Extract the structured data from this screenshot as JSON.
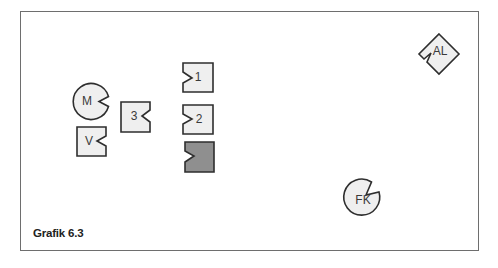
{
  "caption": "Grafik 6.3",
  "colors": {
    "fill": "#efefef",
    "dark_fill": "#8f8f8f",
    "stroke": "#2e2e2e",
    "frame": "#6e6e6e"
  },
  "shapes": [
    {
      "id": "M",
      "label": "M",
      "type": "circle-notch"
    },
    {
      "id": "V",
      "label": "V",
      "type": "square-notch"
    },
    {
      "id": "3",
      "label": "3",
      "type": "square-notch"
    },
    {
      "id": "1",
      "label": "1",
      "type": "square-notch-left"
    },
    {
      "id": "2",
      "label": "2",
      "type": "square-notch-left"
    },
    {
      "id": "dark",
      "label": "",
      "type": "square-notch-left-dark"
    },
    {
      "id": "AL",
      "label": "AL",
      "type": "diamond-notch"
    },
    {
      "id": "FK",
      "label": "FK",
      "type": "circle-notch"
    }
  ]
}
